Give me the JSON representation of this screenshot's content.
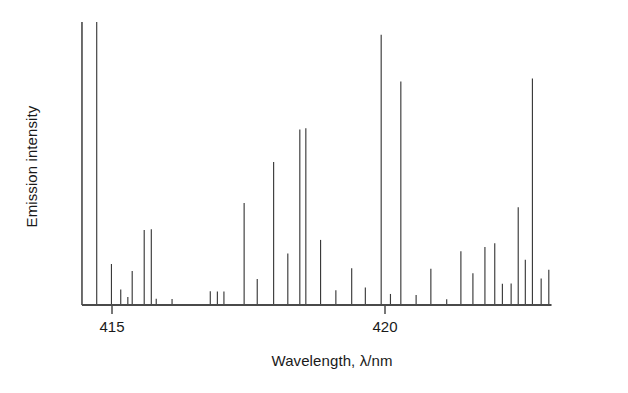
{
  "chart_data": {
    "type": "bar",
    "title": "",
    "subtitle": "",
    "xlabel": "Wavelength, λ/nm",
    "ylabel": "Emission intensity",
    "xlim": [
      414.45,
      423.05
    ],
    "ylim": [
      0,
      1
    ],
    "grid": false,
    "legend": null,
    "xticks": [
      415,
      420
    ],
    "xticklabels": [
      "415",
      "420"
    ],
    "yticks": [],
    "yticklabels": [],
    "x_unit": "nm",
    "series_name": "emission lines",
    "x": [
      414.72,
      414.99,
      415.16,
      415.29,
      415.37,
      415.59,
      415.72,
      415.81,
      416.1,
      416.8,
      416.93,
      417.05,
      417.42,
      417.66,
      417.96,
      418.22,
      418.44,
      418.55,
      418.82,
      419.1,
      419.39,
      419.64,
      419.93,
      420.1,
      420.29,
      420.57,
      420.84,
      421.13,
      421.39,
      421.61,
      421.83,
      422.01,
      422.15,
      422.31,
      422.44,
      422.57,
      422.7,
      422.86,
      423.0
    ],
    "y": [
      1.0,
      0.145,
      0.055,
      0.028,
      0.12,
      0.265,
      0.268,
      0.022,
      0.021,
      0.049,
      0.048,
      0.048,
      0.36,
      0.092,
      0.505,
      0.182,
      0.62,
      0.625,
      0.23,
      0.052,
      0.13,
      0.062,
      0.955,
      0.039,
      0.79,
      0.035,
      0.128,
      0.02,
      0.19,
      0.112,
      0.205,
      0.218,
      0.075,
      0.076,
      0.345,
      0.16,
      0.8,
      0.094,
      0.125
    ],
    "values_note": "Relative emission intensity, normalized to the strongest line at 414.72 nm"
  },
  "axis": {
    "y_axis_label": "Emission intensity",
    "x_axis_label": "Wavelength, λ/nm",
    "tick_415": "415",
    "tick_420": "420"
  },
  "style": {
    "line_color": "#3a3a3a",
    "axis_color": "#4a4a4a",
    "background": "#ffffff"
  }
}
